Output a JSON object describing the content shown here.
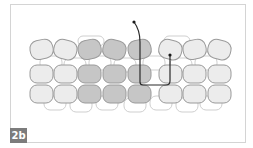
{
  "figure": {
    "label": "2b",
    "colors": {
      "frame": "#d4d4d4",
      "bead_light_fill": "#ececec",
      "bead_dark_fill": "#c6c6c6",
      "bead_stroke": "#9a9a9a",
      "back_layer_stroke": "#cfcfcf",
      "thread": "#2a2a2a",
      "label_bg": "#7c7c7c",
      "label_text": "#ffffff"
    },
    "beadwork": {
      "rows": 3,
      "columns": 8,
      "highlighted_columns": [
        3,
        4,
        5
      ],
      "description": "Three rows of beads; middle three columns shaded darker; thread path enters from above, passes down through column 5, across bottom, and exits up through column 6."
    }
  }
}
